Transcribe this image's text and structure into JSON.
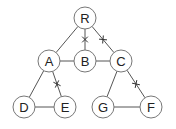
{
  "diagram": {
    "type": "graph",
    "node_radius": 11,
    "nodes": [
      {
        "id": "R",
        "label": "R",
        "x": 85,
        "y": 18
      },
      {
        "id": "A",
        "label": "A",
        "x": 49,
        "y": 61
      },
      {
        "id": "B",
        "label": "B",
        "x": 85,
        "y": 61
      },
      {
        "id": "C",
        "label": "C",
        "x": 121,
        "y": 61
      },
      {
        "id": "D",
        "label": "D",
        "x": 24,
        "y": 107
      },
      {
        "id": "E",
        "label": "E",
        "x": 65,
        "y": 107
      },
      {
        "id": "G",
        "label": "G",
        "x": 103,
        "y": 107
      },
      {
        "id": "F",
        "label": "F",
        "x": 151,
        "y": 107
      }
    ],
    "edges": [
      {
        "from": "R",
        "to": "A",
        "cut": false
      },
      {
        "from": "R",
        "to": "B",
        "cut": true
      },
      {
        "from": "R",
        "to": "C",
        "cut": true
      },
      {
        "from": "A",
        "to": "B",
        "cut": false
      },
      {
        "from": "B",
        "to": "C",
        "cut": false
      },
      {
        "from": "A",
        "to": "D",
        "cut": false
      },
      {
        "from": "A",
        "to": "E",
        "cut": true
      },
      {
        "from": "D",
        "to": "E",
        "cut": false
      },
      {
        "from": "C",
        "to": "G",
        "cut": false
      },
      {
        "from": "C",
        "to": "F",
        "cut": true
      },
      {
        "from": "G",
        "to": "F",
        "cut": false
      }
    ]
  }
}
